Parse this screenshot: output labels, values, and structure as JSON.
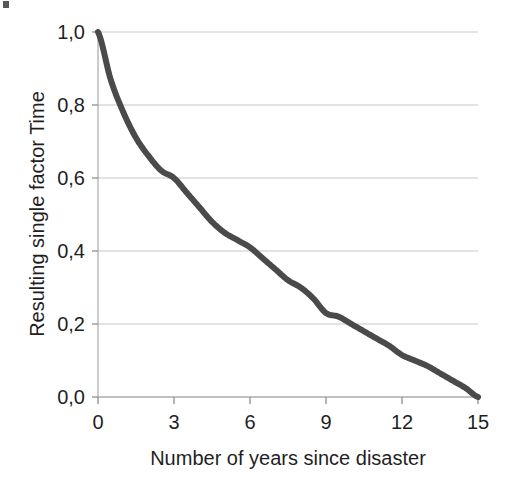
{
  "figure": {
    "background_color": "#ffffff",
    "artifact_name": "scan-speck"
  },
  "chart_data": {
    "type": "line",
    "title": "",
    "subtitle": "",
    "xlabel": "Number of years since disaster",
    "ylabel": "Resulting single factor Time",
    "xlim": [
      0,
      15
    ],
    "ylim": [
      0.0,
      1.0
    ],
    "xticks": [
      0,
      3,
      6,
      9,
      12,
      15
    ],
    "yticks": [
      0.0,
      0.2,
      0.4,
      0.6,
      0.8,
      1.0
    ],
    "xtick_labels": [
      "0",
      "3",
      "6",
      "9",
      "12",
      "15"
    ],
    "ytick_labels": [
      "0,0",
      "0,2",
      "0,4",
      "0,6",
      "0,8",
      "1,0"
    ],
    "decimal_separator": ",",
    "grid": {
      "horizontal": true,
      "vertical": false,
      "color": "#c8c8c8"
    },
    "legend": {
      "visible": false,
      "position": "none",
      "entries": []
    },
    "annotations": [],
    "line_color": "#4a4a4a",
    "line_width_px": 6,
    "series": [
      {
        "name": "Resulting single factor Time",
        "x": [
          0,
          0.5,
          1,
          1.5,
          2,
          2.5,
          3,
          3.5,
          4,
          4.5,
          5,
          5.5,
          6,
          6.5,
          7,
          7.5,
          8,
          8.5,
          9,
          9.5,
          10,
          10.5,
          11,
          11.5,
          12,
          12.5,
          13,
          13.5,
          14,
          14.5,
          15
        ],
        "values": [
          1.0,
          0.87,
          0.78,
          0.71,
          0.66,
          0.62,
          0.6,
          0.56,
          0.52,
          0.48,
          0.45,
          0.43,
          0.41,
          0.38,
          0.35,
          0.32,
          0.3,
          0.27,
          0.23,
          0.22,
          0.2,
          0.18,
          0.16,
          0.14,
          0.115,
          0.1,
          0.085,
          0.065,
          0.045,
          0.025,
          0.0
        ]
      }
    ]
  },
  "plot_geometry": {
    "left_px": 98,
    "right_px": 478,
    "top_px": 32,
    "bottom_px": 397
  }
}
